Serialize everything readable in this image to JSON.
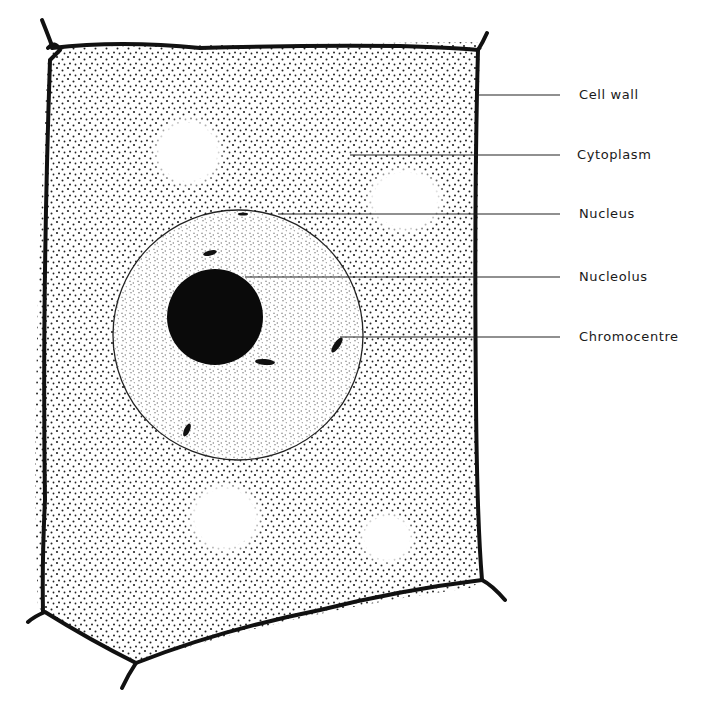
{
  "diagram": {
    "colors": {
      "ink": "#111111",
      "background": "#ffffff",
      "nucleolus": "#0a0a0a"
    },
    "labels": [
      {
        "id": "cell-wall",
        "text": "Cell wall",
        "y": 95
      },
      {
        "id": "cytoplasm",
        "text": "Cytoplasm",
        "y": 155
      },
      {
        "id": "nucleus",
        "text": "Nucleus",
        "y": 214
      },
      {
        "id": "nucleolus",
        "text": "Nucleolus",
        "y": 277
      },
      {
        "id": "chromocentre",
        "text": "Chromocentre",
        "y": 337
      }
    ]
  }
}
